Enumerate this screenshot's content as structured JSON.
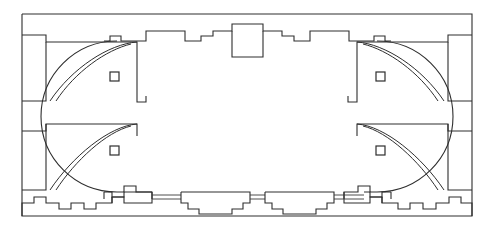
{
  "document": {
    "kind": "architectural-floor-plan",
    "title": "",
    "subtitle": "",
    "orientation": "landscape",
    "canvas": {
      "width": 496,
      "height": 232
    },
    "background_color": "#ffffff",
    "line_color": "#2e2e2e",
    "thin_line_color": "#3a3a3a",
    "label_text": "",
    "scale_note": "",
    "north_arrow": false
  },
  "chart_data": {
    "type": "table",
    "title": "",
    "xlabel": "",
    "ylabel": "",
    "categories": [
      "outer-enclosure",
      "inner-oval-hall",
      "corner-niche",
      "pier",
      "top-central-bay",
      "bottom-bay",
      "connecting-corridor"
    ],
    "values": [
      1,
      1,
      4,
      4,
      1,
      2,
      3
    ]
  },
  "geometry": {
    "outer_wall": {
      "name": "outer-enclosure-rectangle",
      "x": 22,
      "y": 14,
      "width": 450,
      "height": 202,
      "points": "22,14 472,14 472,216 22,216 22,14"
    },
    "inner_hall": {
      "name": "inner-oval-hall",
      "description": "stadium-shaped hall with stepped crenellated perimeter walls",
      "left_center_x": 117,
      "right_center_x": 377,
      "top_y": 41,
      "bottom_y": 192,
      "radius": 76
    },
    "top_wall_path": "104,41 110,41 110,36 121,36 121,41 146,41 146,31 185,31 185,41 201,41 201,36 213,36 213,31 232,31 232,24 263,24 263,31 282,31 282,36 294,36 294,41 310,41 310,31 349,31 349,41 374,41 374,36 385,36 385,41 391,41",
    "bottom_wall_path": "104,192 112,192 112,197 124,197 124,192 150,192 150,203 190,203 190,197 201,197 201,203 222,203 222,209 272,209 272,203 293,203 293,197 304,197 304,203 344,203 344,192 370,192 370,197 382,197 382,192 391,192",
    "outer_bottom_step_path_left": "22,216 22,203 34,203 34,197 46,197 46,203 59,203 59,209 71,209 71,203 84,203 84,209 96,209 96,203 112,203 112,197",
    "outer_bottom_step_path_right": "382,197 382,203 398,203 398,209 410,209 410,203 423,203 423,209 436,209 436,203 449,203 449,197 461,197 461,203 472,203 472,216"
  },
  "corner_niches": [
    {
      "name": "corner-niche-top-left",
      "corner": "top-left",
      "apex_x": 46,
      "apex_y": 42,
      "leg_x": 117,
      "leg_y": 101,
      "arc_outer": "M 46,42 A 71,59 0 0 1 117,101",
      "arc_inner": "M 52,42 A 65,53 0 0 1 117,95"
    },
    {
      "name": "corner-niche-top-right",
      "corner": "top-right",
      "apex_x": 448,
      "apex_y": 42,
      "leg_x": 377,
      "leg_y": 101,
      "arc_outer": "M 448,42 A 71,59 0 0 0 377,101",
      "arc_inner": "M 442,42 A 65,53 0 0 0 377,95"
    },
    {
      "name": "corner-niche-bottom-left",
      "corner": "bottom-left",
      "apex_x": 46,
      "apex_y": 190,
      "leg_x": 117,
      "leg_y": 131,
      "arc_outer": "M 46,190 A 71,59 0 0 0 117,131",
      "arc_inner": "M 52,190 A 65,53 0 0 0 117,137"
    },
    {
      "name": "corner-niche-bottom-right",
      "corner": "bottom-right",
      "apex_x": 448,
      "apex_y": 190,
      "leg_x": 377,
      "leg_y": 131,
      "arc_outer": "M 448,190 A 71,59 0 0 1 377,131",
      "arc_inner": "M 442,190 A 65,53 0 0 1 377,137"
    }
  ],
  "piers": [
    {
      "name": "pier-top-left",
      "x": 110,
      "y": 72,
      "size": 9
    },
    {
      "name": "pier-top-right",
      "x": 376,
      "y": 72,
      "size": 9
    },
    {
      "name": "pier-bottom-left",
      "x": 110,
      "y": 146,
      "size": 9
    },
    {
      "name": "pier-bottom-right",
      "x": 376,
      "y": 146,
      "size": 9
    }
  ],
  "bays": [
    {
      "name": "top-central-bay",
      "position": "top-center",
      "x": 232,
      "y": 24,
      "width": 31,
      "height": 33,
      "shape": "rectangular projecting bay"
    },
    {
      "name": "bottom-bay-left",
      "position": "bottom-left-of-center",
      "outline": "181,192 250,192 250,203 243,203 243,209 232,209 232,214 199,214 199,209 188,209 188,203 181,203 181,192",
      "shape": "stepped trapezoid bay"
    },
    {
      "name": "bottom-bay-right",
      "position": "bottom-right-of-center",
      "outline": "265,192 334,192 334,203 327,203 327,209 316,209 316,214 283,214 283,209 272,209 272,203 265,203 265,192",
      "shape": "stepped trapezoid bay"
    }
  ],
  "corridors": [
    {
      "name": "corridor-left",
      "x1": 152,
      "x2": 181,
      "y_top": 195,
      "y_bottom": 199
    },
    {
      "name": "corridor-middle",
      "x1": 250,
      "x2": 265,
      "y_top": 195,
      "y_bottom": 199
    },
    {
      "name": "corridor-right",
      "x1": 334,
      "x2": 364,
      "y_top": 195,
      "y_bottom": 199
    }
  ]
}
